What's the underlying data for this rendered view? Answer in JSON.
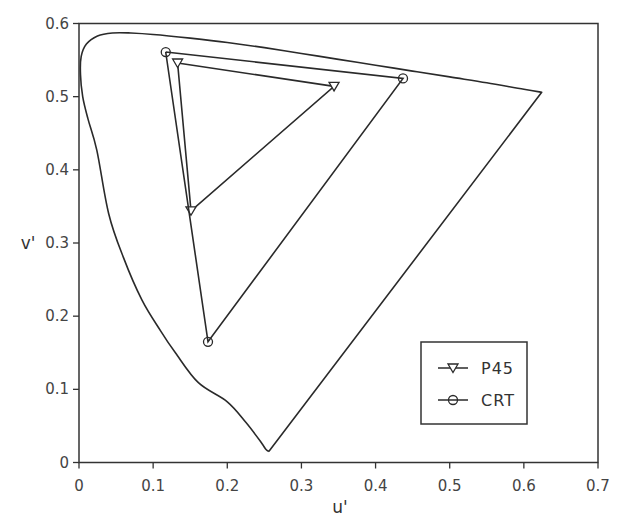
{
  "chart_data": {
    "type": "line",
    "title": "",
    "xlabel": "u'",
    "ylabel": "v'",
    "xlim": [
      0,
      0.7
    ],
    "ylim": [
      0,
      0.6
    ],
    "xticks": [
      0,
      0.1,
      0.2,
      0.3,
      0.4,
      0.5,
      0.6,
      0.7
    ],
    "yticks": [
      0,
      0.1,
      0.2,
      0.3,
      0.4,
      0.5,
      0.6
    ],
    "xtick_labels": [
      "0",
      "0.1",
      "0.2",
      "0.3",
      "0.4",
      "0.5",
      "0.6",
      "0.7"
    ],
    "ytick_labels": [
      "0",
      "0.1",
      "0.2",
      "0.3",
      "0.4",
      "0.5",
      "0.6"
    ],
    "grid": false,
    "legend_position": "lower right",
    "spectral_locus": {
      "name": "Spectral locus",
      "u": [
        0.256,
        0.252,
        0.246,
        0.225,
        0.2,
        0.161,
        0.13,
        0.11,
        0.085,
        0.06,
        0.04,
        0.024,
        0.012,
        0.005,
        0.002,
        0.003,
        0.01,
        0.025,
        0.045,
        0.07,
        0.1,
        0.15,
        0.2,
        0.25,
        0.3,
        0.35,
        0.4,
        0.45,
        0.5,
        0.55,
        0.6,
        0.624,
        0.256
      ],
      "v": [
        0.015,
        0.018,
        0.027,
        0.055,
        0.083,
        0.109,
        0.15,
        0.18,
        0.222,
        0.28,
        0.34,
        0.427,
        0.47,
        0.5,
        0.53,
        0.555,
        0.572,
        0.583,
        0.587,
        0.587,
        0.585,
        0.58,
        0.574,
        0.567,
        0.559,
        0.551,
        0.543,
        0.535,
        0.527,
        0.519,
        0.51,
        0.506,
        0.015
      ]
    },
    "series": [
      {
        "name": "P45",
        "marker": "triangle-down",
        "u": [
          0.133,
          0.344,
          0.151,
          0.133
        ],
        "v": [
          0.546,
          0.514,
          0.344,
          0.546
        ]
      },
      {
        "name": "CRT",
        "marker": "circle",
        "u": [
          0.117,
          0.437,
          0.174,
          0.117
        ],
        "v": [
          0.561,
          0.525,
          0.165,
          0.561
        ]
      }
    ]
  },
  "legend": {
    "items": [
      {
        "label": "P45",
        "marker": "triangle-down"
      },
      {
        "label": "CRT",
        "marker": "circle"
      }
    ]
  },
  "colors": {
    "line": "#2a2a2a",
    "axis": "#333333",
    "background": "#ffffff"
  }
}
